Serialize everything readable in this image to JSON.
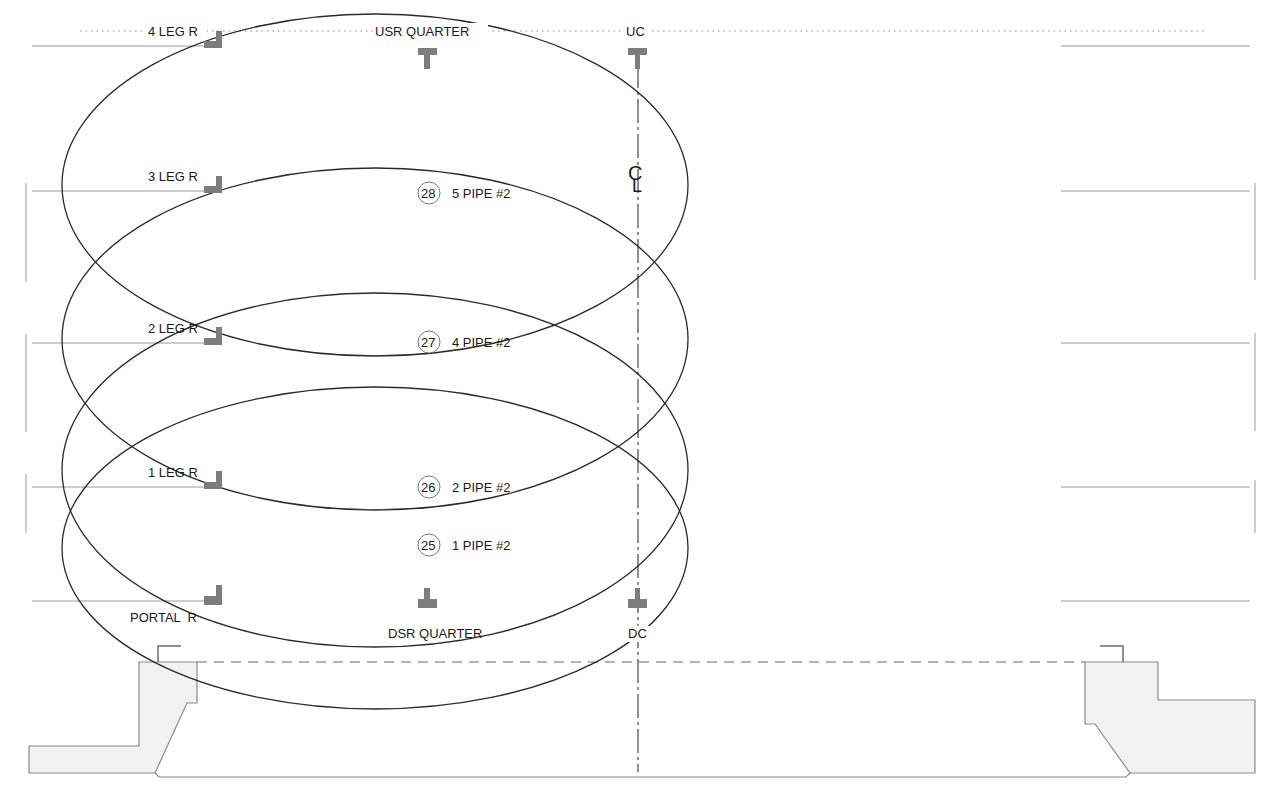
{
  "diagram": {
    "type": "rigging-plot-section",
    "colors": {
      "line": "#2a2a2a",
      "grid": "#9a9a9a",
      "fitting": "#7a7a7a",
      "stage_fill": "#f2f2f2",
      "stage_stroke": "#8a8a8a"
    },
    "top_labels": {
      "leg4": "4 LEG R",
      "usr_quarter": "USR QUARTER",
      "uc": "UC"
    },
    "bottom_labels": {
      "portal": "PORTAL  R",
      "dsr_quarter": "DSR QUARTER",
      "dc": "DC"
    },
    "legs": [
      {
        "label": "3 LEG R",
        "y": 190
      },
      {
        "label": "2 LEG R",
        "y": 342
      },
      {
        "label": "1 LEG R",
        "y": 486
      }
    ],
    "centerline_symbol": "CL",
    "pipes": [
      {
        "number": "28",
        "label": "5 PIPE #2",
        "y": 193
      },
      {
        "number": "27",
        "label": "4 PIPE #2",
        "y": 342
      },
      {
        "number": "26",
        "label": "2 PIPE #2",
        "y": 487
      },
      {
        "number": "25",
        "label": "1 PIPE #2",
        "y": 545
      }
    ],
    "ellipses": [
      {
        "name": "ellipse-1",
        "cx": 375,
        "cy": 185,
        "rx": 313,
        "ry": 171
      },
      {
        "name": "ellipse-2",
        "cx": 375,
        "cy": 339,
        "rx": 313,
        "ry": 171
      },
      {
        "name": "ellipse-3",
        "cx": 375,
        "cy": 470,
        "rx": 313,
        "ry": 177
      },
      {
        "name": "ellipse-4",
        "cx": 375,
        "cy": 548,
        "rx": 313,
        "ry": 161
      }
    ]
  }
}
